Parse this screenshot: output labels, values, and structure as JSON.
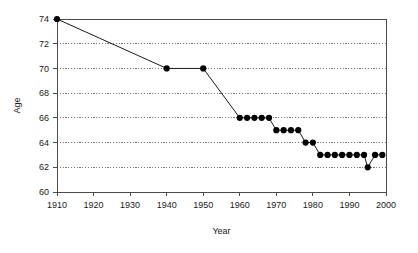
{
  "chart_data": {
    "type": "line",
    "title": "",
    "xlabel": "Year",
    "ylabel": "Age",
    "xlim": [
      1910,
      2000
    ],
    "ylim": [
      60,
      74
    ],
    "xticks": [
      1910,
      1920,
      1930,
      1940,
      1950,
      1960,
      1970,
      1980,
      1990,
      2000
    ],
    "yticks": [
      60,
      62,
      64,
      66,
      68,
      70,
      72,
      74
    ],
    "grid": "horizontal-dotted",
    "legend": "none",
    "marker": "filled-circle",
    "marker_color": "#000000",
    "line_color": "#1a1a1a",
    "series": [
      {
        "name": "Age",
        "x": [
          1910,
          1940,
          1950,
          1960,
          1962,
          1964,
          1966,
          1968,
          1970,
          1972,
          1974,
          1976,
          1978,
          1980,
          1982,
          1984,
          1986,
          1988,
          1990,
          1992,
          1994,
          1995,
          1997,
          1999
        ],
        "values": [
          74,
          70,
          70,
          66,
          66,
          66,
          66,
          66,
          65,
          65,
          65,
          65,
          64,
          64,
          63,
          63,
          63,
          63,
          63,
          63,
          63,
          62,
          63,
          63
        ]
      }
    ]
  },
  "axis": {
    "y_title": "Age",
    "x_title": "Year",
    "x_tick_labels": [
      "1910",
      "1920",
      "1930",
      "1940",
      "1950",
      "1960",
      "1970",
      "1980",
      "1990",
      "2000"
    ],
    "y_tick_labels": [
      "60",
      "62",
      "64",
      "66",
      "68",
      "70",
      "72",
      "74"
    ]
  }
}
